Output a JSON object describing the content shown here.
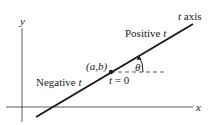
{
  "diagram": {
    "axes": {
      "x_label": "x",
      "y_label": "y"
    },
    "line": {
      "label": "t axis",
      "color": "#1a1a1a"
    },
    "point": {
      "label": "(a,b)",
      "param_label": "t = 0"
    },
    "angle": {
      "label": "θ"
    },
    "regions": {
      "positive": "Positive t",
      "negative": "Negative t"
    }
  }
}
